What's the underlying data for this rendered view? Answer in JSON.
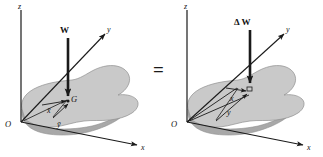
{
  "figure": {
    "colors": {
      "body_top": "#c9c9c9",
      "body_edge": "#a8a8a8",
      "body_outline": "#8f8f8f",
      "line": "#1a1a1a",
      "text": "#111111",
      "background": "#ffffff"
    },
    "equals_sign": "=",
    "left_diagram": {
      "name": "total-weight-diagram",
      "force_label": "W",
      "axis_z_label": "z",
      "axis_y_label": "y",
      "axis_x_label": "x",
      "origin_label": "O",
      "centroid_label": "G",
      "distance_x_label": "x̄",
      "distance_y_label": "ȳ"
    },
    "right_diagram": {
      "name": "differential-weight-diagram",
      "force_label": "Δ W",
      "axis_z_label": "z",
      "axis_y_label": "y",
      "axis_x_label": "x",
      "origin_label": "O",
      "distance_x_label": "x",
      "distance_y_label": "y"
    }
  }
}
